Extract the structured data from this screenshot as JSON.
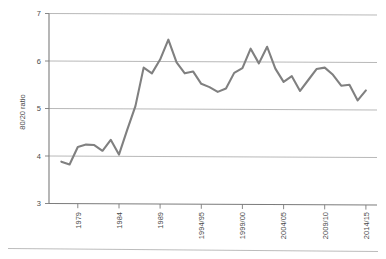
{
  "chart_data": {
    "type": "line",
    "title": "",
    "subtitle": "",
    "xlabel": "",
    "ylabel": "80/20 ratio",
    "ylim": [
      3,
      7
    ],
    "yticks": [
      3,
      4,
      5,
      6,
      7
    ],
    "ytick_labels": [
      "3",
      "4",
      "5",
      "6",
      "7"
    ],
    "grid": true,
    "legend": "none",
    "xtick_labels": [
      "1979",
      "1984",
      "1989",
      "1994/95",
      "1999/00",
      "2004/05",
      "2009/10",
      "2014/15"
    ],
    "xtick_values": [
      1979,
      1984,
      1989,
      1994,
      1999,
      2004,
      2009,
      2014
    ],
    "x": [
      1977,
      1978,
      1979,
      1980,
      1981,
      1982,
      1983,
      1984,
      1985,
      1986,
      1987,
      1988,
      1989,
      1990,
      1991,
      1992,
      1993,
      1994,
      1995,
      1996,
      1997,
      1998,
      1999,
      2000,
      2001,
      2002,
      2003,
      2004,
      2005,
      2006,
      2007,
      2008,
      2009,
      2010,
      2011,
      2012,
      2013,
      2014
    ],
    "series": [
      {
        "name": "80/20 ratio",
        "color": "#808080",
        "values": [
          3.88,
          3.82,
          4.19,
          4.24,
          4.23,
          4.11,
          4.34,
          4.03,
          4.55,
          5.05,
          5.86,
          5.74,
          6.03,
          6.45,
          5.97,
          5.74,
          5.78,
          5.52,
          5.45,
          5.35,
          5.42,
          5.75,
          5.85,
          6.26,
          5.95,
          6.3,
          5.84,
          5.56,
          5.68,
          5.37,
          5.6,
          5.83,
          5.86,
          5.71,
          5.48,
          5.5,
          5.17,
          5.38
        ]
      }
    ]
  },
  "axes": {
    "y_axis_title": "80/20 ratio"
  }
}
